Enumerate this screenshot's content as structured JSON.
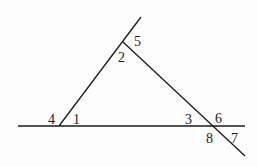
{
  "diagram": {
    "type": "triangle-with-extended-sides",
    "stroke_color": "#1a1a1a",
    "background": "#fdfdfd",
    "lines": [
      {
        "name": "base-line",
        "x1": 18,
        "y1": 126,
        "x2": 245,
        "y2": 126
      },
      {
        "name": "left-side-line",
        "x1": 59,
        "y1": 126,
        "x2": 141,
        "y2": 17
      },
      {
        "name": "right-side-line",
        "x1": 123,
        "y1": 42,
        "x2": 245,
        "y2": 156
      }
    ],
    "angle_labels": [
      {
        "id": "1",
        "text": "1",
        "x": 73,
        "y": 124
      },
      {
        "id": "2",
        "text": "2",
        "x": 118,
        "y": 62
      },
      {
        "id": "3",
        "text": "3",
        "x": 185,
        "y": 124
      },
      {
        "id": "4",
        "text": "4",
        "x": 48,
        "y": 124
      },
      {
        "id": "5",
        "text": "5",
        "x": 134,
        "y": 46
      },
      {
        "id": "6",
        "text": "6",
        "x": 215,
        "y": 123
      },
      {
        "id": "7",
        "text": "7",
        "x": 231,
        "y": 143
      },
      {
        "id": "8",
        "text": "8",
        "x": 206,
        "y": 143
      }
    ]
  }
}
